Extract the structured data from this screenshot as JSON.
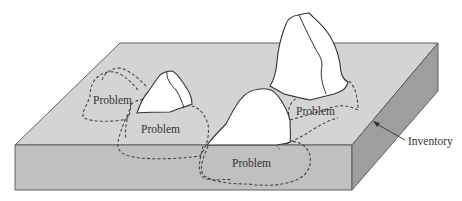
{
  "diagram": {
    "colors": {
      "background": "#ffffff",
      "top_face": "#d4d4d4",
      "front_face": "#c0c0c0",
      "side_face": "#9e9e9e",
      "rock_fill": "#ffffff",
      "outline": "#333333",
      "dashed": "#444444",
      "text": "#333333"
    },
    "labels": {
      "problem_1": "Problem",
      "problem_2": "Problem",
      "problem_3": "Problem",
      "problem_4": "Problem",
      "inventory": "Inventory"
    }
  }
}
